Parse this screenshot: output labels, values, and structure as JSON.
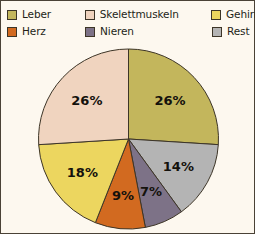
{
  "chart_data": {
    "type": "pie",
    "title": "",
    "categories": [
      "Leber",
      "Rest",
      "Nieren",
      "Herz",
      "Gehirn",
      "Skelettmuskeln"
    ],
    "values": [
      26,
      14,
      7,
      9,
      18,
      26
    ],
    "value_labels": [
      "26%",
      "14%",
      "7%",
      "9%",
      "18%",
      "26%"
    ],
    "unit": "%",
    "start_angle_deg": 0,
    "direction": "clockwise",
    "legend_position": "top",
    "grid": false,
    "slices": [
      {
        "label": "Leber",
        "value": 26,
        "value_label": "26%",
        "color": "#c3b65c",
        "order": 1
      },
      {
        "label": "Rest",
        "value": 14,
        "value_label": "14%",
        "color": "#b4b4b4",
        "order": 2
      },
      {
        "label": "Nieren",
        "value": 7,
        "value_label": "7%",
        "color": "#7d7287",
        "order": 3
      },
      {
        "label": "Herz",
        "value": 9,
        "value_label": "9%",
        "color": "#d26a20",
        "order": 4
      },
      {
        "label": "Gehirn",
        "value": 18,
        "value_label": "18%",
        "color": "#ecd65f",
        "order": 5
      },
      {
        "label": "Skelettmuskeln",
        "value": 26,
        "value_label": "26%",
        "color": "#f0d4bf",
        "order": 6
      }
    ]
  },
  "legend": {
    "rows": [
      [
        {
          "label": "Leber",
          "color": "#c3b65c"
        },
        {
          "label": "Skelettmuskeln",
          "color": "#f0d4bf"
        },
        {
          "label": "Gehirn",
          "color": "#ecd65f"
        }
      ],
      [
        {
          "label": "Herz",
          "color": "#d26a20"
        },
        {
          "label": "Nieren",
          "color": "#7d7287"
        },
        {
          "label": "Rest",
          "color": "#b4b4b4"
        }
      ]
    ]
  },
  "style": {
    "background": "#fdf8ef",
    "border_color": "#4a4236",
    "slice_outline": "#3d3527",
    "text_color": "#231f18"
  }
}
